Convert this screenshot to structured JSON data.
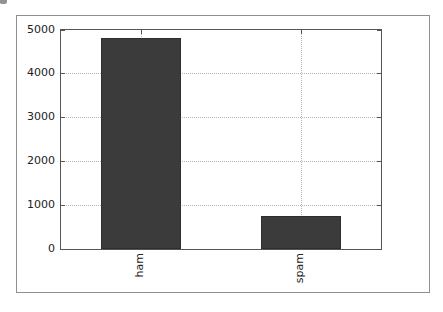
{
  "chart_data": {
    "type": "bar",
    "categories": [
      "ham",
      "spam"
    ],
    "values": [
      4825,
      747
    ],
    "title": "",
    "xlabel": "",
    "ylabel": "",
    "ylim": [
      0,
      5000
    ],
    "yticks": [
      0,
      1000,
      2000,
      3000,
      4000,
      5000
    ],
    "ytick_labels": [
      "0",
      "1000",
      "2000",
      "3000",
      "4000",
      "5000"
    ],
    "grid": true,
    "grid_style": "dotted",
    "legend_position": "none",
    "xtick_rotation": 90,
    "bar_color": "#3b3b3b",
    "bar_edge_color": "#2e2e2e"
  },
  "colors": {
    "background": "#ffffff",
    "figure_border": "#8f8f8f",
    "axes_frame": "#555555",
    "grid": "#b5b5b5",
    "tick": "#555555",
    "tick_label": "#222222"
  }
}
